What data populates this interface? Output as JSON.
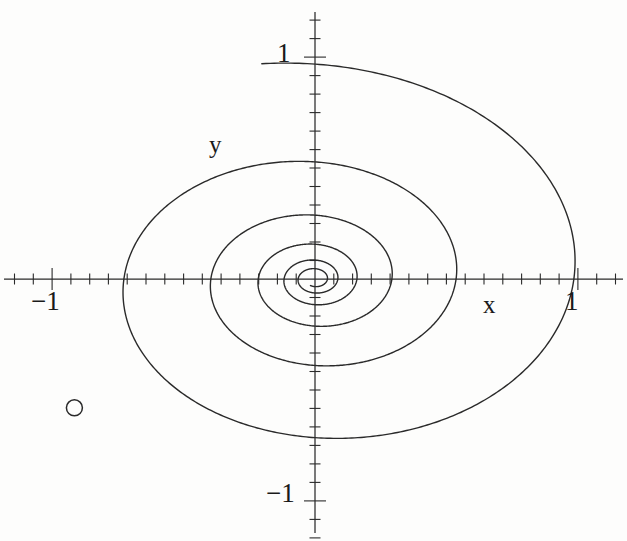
{
  "figure": {
    "kind": "phase-portrait",
    "background_color": "#fdfdfc",
    "curve_color": "#2a2a2a",
    "axis_color": "#2a2a2a"
  },
  "axes": {
    "x_name": "x",
    "y_name": "y",
    "x_tick_labels": [
      {
        "value": -1,
        "text": "−1"
      },
      {
        "value": 1,
        "text": "1"
      }
    ],
    "y_tick_labels": [
      {
        "value": 1,
        "text": "1"
      },
      {
        "value": -1,
        "text": "−1"
      }
    ]
  },
  "marker": {
    "shape": "open-circle",
    "x": -0.915,
    "y": -0.58,
    "radius_px": 8
  },
  "chart_data": {
    "type": "line",
    "title": "",
    "subtitle": "",
    "xlabel": "x",
    "ylabel": "y",
    "xlim": [
      -1.19,
      1.19
    ],
    "ylim": [
      -1.22,
      1.22
    ],
    "grid": false,
    "legend": null,
    "annotations": [
      {
        "text": "x",
        "x": 0.64,
        "y": -0.1
      },
      {
        "text": "y",
        "x": -0.4,
        "y": 0.62
      },
      {
        "text": "1",
        "x": -0.13,
        "y": 1.0
      },
      {
        "text": "−1",
        "x": -0.17,
        "y": -0.98
      },
      {
        "text": "1",
        "x": 0.96,
        "y": -0.1
      },
      {
        "text": "−1",
        "x": -1.06,
        "y": -0.1
      }
    ],
    "series": [
      {
        "name": "spiral-trajectory",
        "curve": "logarithmic-spiral",
        "r0": 1.165,
        "decay_per_turn": 0.545,
        "theta_start_deg": 100,
        "turns": 5.6,
        "direction": "clockwise",
        "x_scale": 1.0,
        "y_scale": 0.845
      }
    ],
    "x_ticks_minor_step": 0.0714,
    "y_ticks_minor_step": 0.0833
  }
}
